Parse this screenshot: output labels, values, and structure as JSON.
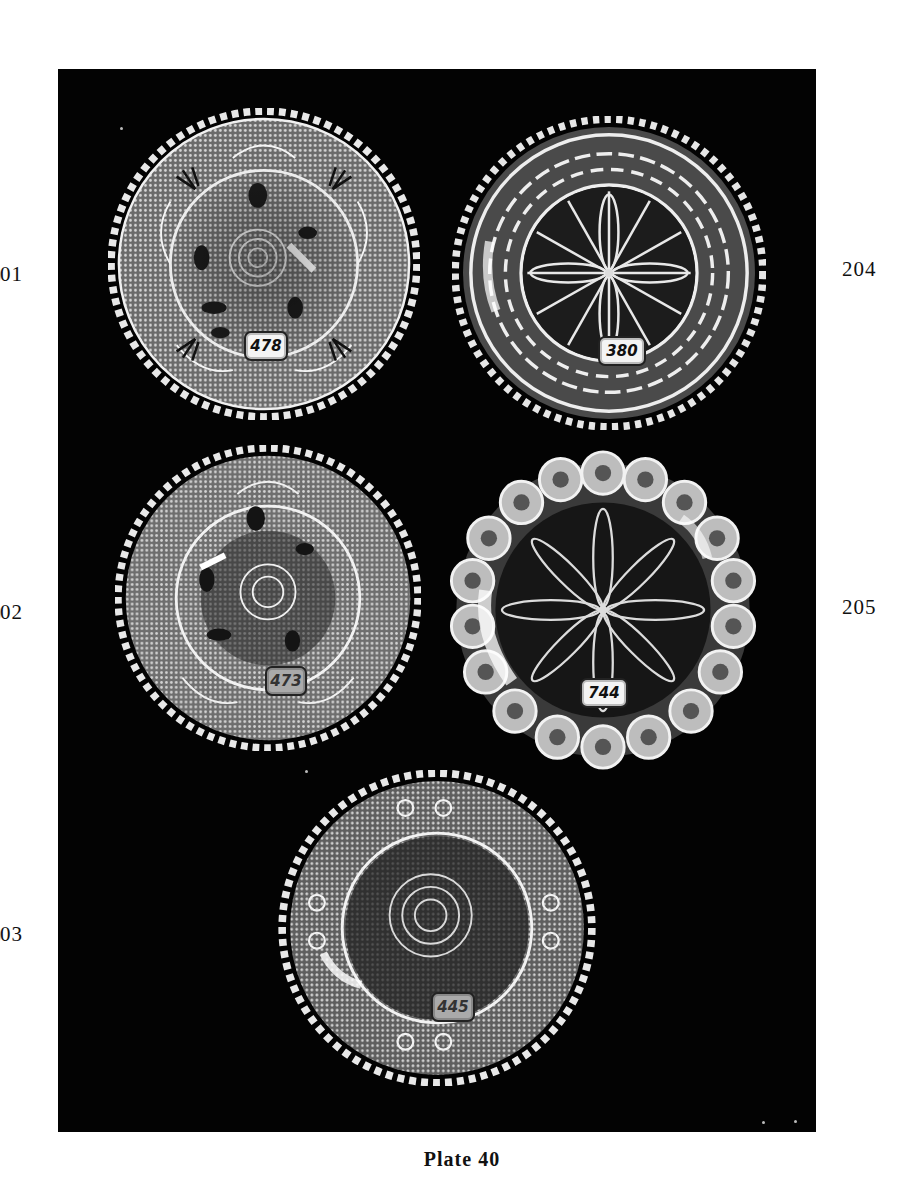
{
  "page": {
    "caption": "Plate 40",
    "background_color": "#ffffff",
    "panel_color": "#030303"
  },
  "side_numbers": {
    "left": [
      "01",
      "02",
      "03"
    ],
    "right": [
      "204",
      "205"
    ]
  },
  "plates": [
    {
      "id": "plate-top-left",
      "tag": "478",
      "pattern": "scalloped-rim floral-center with fan/shell border"
    },
    {
      "id": "plate-top-right",
      "tag": "380",
      "pattern": "scalloped-rim star-burst center with wave/scroll border"
    },
    {
      "id": "plate-middle-left",
      "tag": "473",
      "pattern": "scalloped-rim floral-center with fan/shell border"
    },
    {
      "id": "plate-middle-right",
      "tag": "744",
      "pattern": "bull's-eye rosette rim with starburst center"
    },
    {
      "id": "plate-bottom-center",
      "tag": "445",
      "pattern": "scalloped-rim floral-center with scroll border"
    }
  ]
}
